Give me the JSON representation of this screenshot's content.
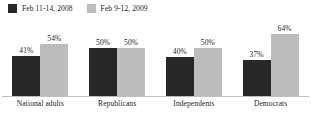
{
  "chart_data": {
    "type": "bar",
    "title": "",
    "subtitle": "",
    "xlabel": "",
    "ylabel": "",
    "ylim": [
      0,
      70
    ],
    "grid": false,
    "legend_position": "top-left",
    "value_suffix": "%",
    "categories": [
      "National adults",
      "Republicans",
      "Independents",
      "Democrats"
    ],
    "series": [
      {
        "name": "Feb 11-14, 2008",
        "color": "#272727",
        "values": [
          41,
          50,
          40,
          37
        ],
        "labels": [
          "41%",
          "50%",
          "40%",
          "37%"
        ]
      },
      {
        "name": "Feb 9-12, 2009",
        "color": "#bcbcbc",
        "values": [
          54,
          50,
          50,
          64
        ],
        "labels": [
          "54%",
          "50%",
          "50%",
          "64%"
        ]
      }
    ]
  },
  "legend": {
    "entries": [
      {
        "label": "Feb 11-14, 2008",
        "swatch": "dark-square-swatch"
      },
      {
        "label": "Feb 9-12, 2009",
        "swatch": "light-square-swatch"
      }
    ]
  },
  "colors": {
    "series_a": "#272727",
    "series_b": "#bcbcbc",
    "axis": "#bdbdbd",
    "text": "#1b1b1b",
    "background": "#ffffff"
  }
}
